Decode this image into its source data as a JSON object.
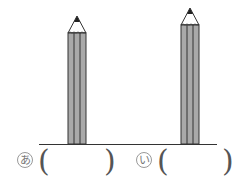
{
  "pencils": [
    {
      "id": "a",
      "label": "あ",
      "tip_y": 16,
      "body_top": 33,
      "x": 68,
      "width": 17
    },
    {
      "id": "b",
      "label": "い",
      "tip_y": 8,
      "body_top": 25,
      "x": 181,
      "width": 17
    }
  ],
  "answers": {
    "a": {
      "open": "(",
      "close": ")",
      "value": ""
    },
    "b": {
      "open": "(",
      "close": ")",
      "value": ""
    }
  },
  "colors": {
    "pencil_body": "#a9a9a9",
    "outline": "#333333",
    "lead": "#222222"
  }
}
